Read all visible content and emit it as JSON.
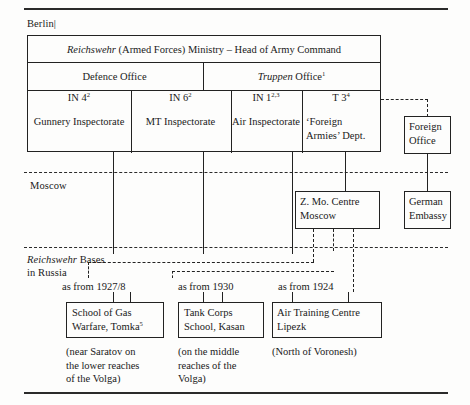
{
  "figure": {
    "regions": [
      {
        "id": "berlin",
        "label": "Berlin|"
      },
      {
        "id": "moscow",
        "label": "Moscow"
      },
      {
        "id": "bases",
        "label_italic": "Reichswehr",
        "label_rest": " Bases",
        "label_line2": "in Russia"
      }
    ],
    "ministry": {
      "italic": "Reichswehr",
      "rest": " (Armed Forces) Ministry  – Head of Army Command"
    },
    "offices": [
      {
        "id": "defence-office",
        "label": "Defence Office",
        "italic": ""
      },
      {
        "id": "truppen-office",
        "label": " Office",
        "italic": "Truppen",
        "sup": "1"
      }
    ],
    "departments": [
      {
        "id": "in4",
        "code": "IN 4",
        "sup": "2",
        "name": "Gunnery Inspectorate"
      },
      {
        "id": "in6",
        "code": "IN 6",
        "sup": "2",
        "name": "MT Inspectorate"
      },
      {
        "id": "in1",
        "code": "IN 1",
        "sup": "2,3",
        "name": "Air Inspectorate"
      },
      {
        "id": "t3",
        "code": "T 3",
        "sup": "4",
        "name_line1": "‘Foreign",
        "name_line2": "Armies’ Dept."
      }
    ],
    "side_boxes": [
      {
        "id": "foreign-office",
        "line1": "Foreign",
        "line2": "Office"
      },
      {
        "id": "german-embassy",
        "line1": "German",
        "line2": "Embassy"
      }
    ],
    "moscow_centre": {
      "id": "z-mo-centre",
      "line1": "Z. Mo. Centre",
      "line2": "Moscow"
    },
    "bases": [
      {
        "id": "tomka",
        "since": "as from 1927/8",
        "line1": "School of Gas",
        "line2": "Warfare, Tomka",
        "sup": "5",
        "note": [
          "(near Saratov on",
          "the lower reaches",
          "of the Volga)"
        ]
      },
      {
        "id": "kasan",
        "since": "as from 1930",
        "line1": "Tank Corps",
        "line2": "School, Kasan",
        "sup": "",
        "note": [
          "(on the middle",
          "reaches of the",
          "Volga)"
        ]
      },
      {
        "id": "lipezk",
        "since": "as from 1924",
        "line1": "Air Training Centre",
        "line2": "Lipezk",
        "sup": "",
        "note": [
          "(North of Voronesh)"
        ]
      }
    ],
    "colors": {
      "ink": "#222222",
      "paper": "#fdfdfc"
    }
  }
}
